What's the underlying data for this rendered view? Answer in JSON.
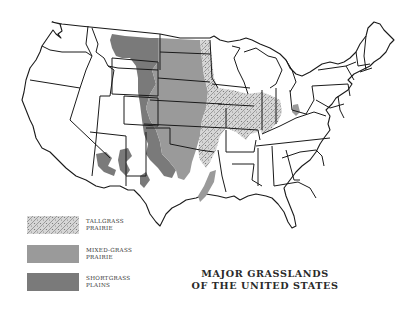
{
  "map": {
    "title_line1": "MAJOR GRASSLANDS",
    "title_line2": "OF THE UNITED STATES",
    "region": "Contiguous United States",
    "legend": [
      {
        "id": "tallgrass",
        "line1": "TALLGRASS",
        "line2": "PRAIRIE",
        "pattern": "stippled-hatch",
        "color": "#b8b8b8"
      },
      {
        "id": "mixedgrass",
        "line1": "MIXED-GRASS",
        "line2": "PRAIRIE",
        "pattern": "solid",
        "color": "#9a9a9a"
      },
      {
        "id": "shortgrass",
        "line1": "SHORTGRASS",
        "line2": "PLAINS",
        "pattern": "solid",
        "color": "#7a7a7a"
      }
    ],
    "colors": {
      "background": "#ffffff",
      "outline": "#1a1a1a",
      "mixed_grass": "#9a9a9a",
      "short_grass": "#7a7a7a",
      "tall_grass": "#b8b8b8"
    }
  }
}
